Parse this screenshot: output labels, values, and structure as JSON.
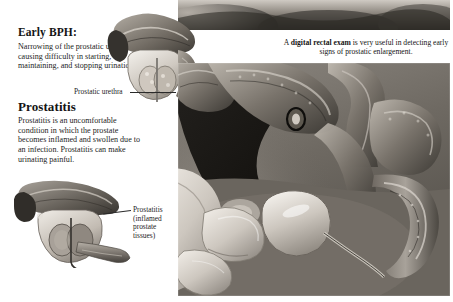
{
  "illustration": {
    "title_alt": "Prostate conditions and digital rectal exam medical illustration",
    "style": "grayscale-airbrush-anatomical"
  },
  "sections": {
    "bph": {
      "heading": "Early BPH:",
      "body": "Narrowing of the prostatic urethra causing difficulty in starting, maintaining, and stopping urination."
    },
    "prostatitis": {
      "heading": "Prostatitis",
      "body": "Prostatitis is an uncomfortable condition in which the prostate becomes inflamed and swollen due to an infection.  Prostatitis can make urinating painful."
    }
  },
  "callouts": {
    "prostatic_urethra": "Prostatic urethra",
    "prostatitis_tissue": "Prostatitis (inflamed prostate tissues)"
  },
  "main_panel": {
    "caption_prefix": "A ",
    "caption_bold": "digital rectal exam",
    "caption_suffix": " is very useful in detecting early signs of prostatic enlargement."
  },
  "colors": {
    "page_background": "#ffffff",
    "text": "#1d1d1d",
    "heading": "#141414",
    "panel_mid_gray": "#6f6f6f",
    "panel_dark": "#2b2b2b",
    "tissue_light": "#d8d4cf",
    "tissue_mid": "#9a948c",
    "tissue_dark": "#4a4640",
    "leader_line": "#2a2a2a"
  }
}
